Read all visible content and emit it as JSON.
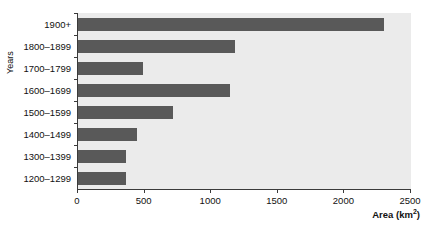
{
  "chart_data": {
    "type": "bar",
    "orientation": "horizontal",
    "title": "",
    "xlabel": "Area (km2)",
    "xlabel_base": "Area (km",
    "xlabel_sup": "2",
    "xlabel_tail": ")",
    "ylabel": "Years",
    "categories": [
      "1900+",
      "1800–1899",
      "1700–1799",
      "1600–1699",
      "1500–1599",
      "1400–1499",
      "1300–1399",
      "1200–1299"
    ],
    "values": [
      2300,
      1180,
      490,
      1140,
      710,
      440,
      360,
      360
    ],
    "xlim": [
      0,
      2500
    ],
    "xticks": [
      0,
      500,
      1000,
      1500,
      2000,
      2500
    ],
    "xticklabels": [
      "0",
      "500",
      "1000",
      "1500",
      "2000",
      "2500"
    ],
    "grid": false,
    "legend": null,
    "bar_color": "#595959",
    "plot_background": "#ebebeb",
    "axis_color": "#3a3a3a",
    "text_color": "#111111"
  }
}
